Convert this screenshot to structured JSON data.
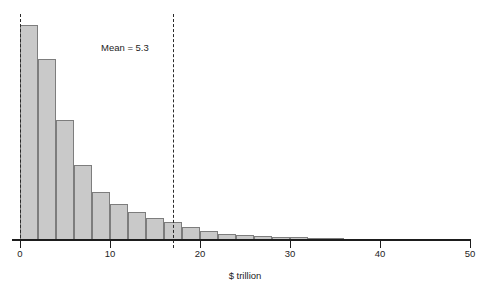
{
  "figure": {
    "clipped_top_title": "",
    "background_color": "#ffffff",
    "bar_fill_color": "#c9c9c9",
    "bar_edge_color": "#7d7d7d",
    "axis_color": "#1d1d1d"
  },
  "annotations": {
    "mean_label": "Mean = 5.3",
    "mean_value": 5.3,
    "median_line_value": 17.0
  },
  "axis": {
    "x_title": "$ trillion",
    "x_ticks": [
      0,
      10,
      20,
      30,
      40,
      50
    ],
    "x_tick_labels": [
      "0",
      "10",
      "20",
      "30",
      "40",
      "50"
    ],
    "x_min": 0,
    "x_max": 50
  },
  "chart_data": {
    "type": "bar",
    "title": "",
    "subtitle": "",
    "xlabel": "$ trillion",
    "ylabel": "",
    "xlim": [
      0,
      50
    ],
    "ylim": [
      0,
      215
    ],
    "grid": false,
    "legend": null,
    "bin_width": 2,
    "categories": [
      "0-2",
      "2-4",
      "4-6",
      "6-8",
      "8-10",
      "10-12",
      "12-14",
      "14-16",
      "16-18",
      "18-20",
      "20-22",
      "22-24",
      "24-26",
      "26-28",
      "28-30",
      "30-32",
      "32-34",
      "34-36",
      "36-38",
      "38-40",
      "40-42",
      "42-44",
      "44-46",
      "46-48"
    ],
    "bin_starts": [
      0,
      2,
      4,
      6,
      8,
      10,
      12,
      14,
      16,
      18,
      20,
      22,
      24,
      26,
      28,
      30,
      32,
      34,
      36,
      38,
      40,
      42,
      44,
      46
    ],
    "values": [
      215,
      181,
      120,
      75,
      48,
      36,
      28,
      22,
      18,
      13,
      9,
      6,
      5,
      4,
      3,
      3,
      2,
      2,
      1,
      1,
      1,
      1,
      0,
      1
    ],
    "vertical_markers": [
      {
        "name": "zero-line",
        "value": 0,
        "style": "dashed"
      },
      {
        "name": "median-line",
        "value": 17.0,
        "style": "dashed"
      }
    ],
    "annotations": [
      {
        "text": "Mean = 5.3",
        "x": 9.0,
        "y": 192
      }
    ]
  }
}
